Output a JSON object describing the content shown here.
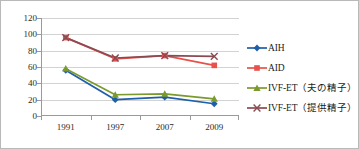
{
  "chart_data": {
    "type": "line",
    "title": "",
    "xlabel": "",
    "ylabel": "",
    "categories": [
      "1991",
      "1997",
      "2007",
      "2009"
    ],
    "ylim": [
      0,
      120
    ],
    "yticks": [
      0,
      20,
      40,
      60,
      80,
      100,
      120
    ],
    "grid": true,
    "legend_position": "right",
    "series": [
      {
        "name": "AIH",
        "marker": "diamond",
        "color": "#1F5FA9",
        "values": [
          56,
          20,
          23,
          15
        ]
      },
      {
        "name": "AID",
        "marker": "square",
        "color": "#E8524A",
        "values": [
          96,
          70,
          74,
          62
        ]
      },
      {
        "name": "IVF-ET（夫の精子）",
        "marker": "triangle",
        "color": "#7B9A2E",
        "values": [
          58,
          26,
          27,
          21
        ]
      },
      {
        "name": "IVF-ET（提供精子）",
        "marker": "x",
        "color": "#8B4A52",
        "values": [
          96,
          71,
          74,
          73
        ]
      }
    ]
  },
  "axis": {
    "ytick_labels": [
      "120",
      "100",
      "80",
      "60",
      "40",
      "20",
      "0"
    ],
    "xtick_labels": [
      "1991",
      "1997",
      "2007",
      "2009"
    ]
  },
  "legend": {
    "items": [
      {
        "label": "AIH"
      },
      {
        "label": "AID"
      },
      {
        "label": "IVF-ET（夫の精子）"
      },
      {
        "label": "IVF-ET（提供精子）"
      }
    ]
  }
}
